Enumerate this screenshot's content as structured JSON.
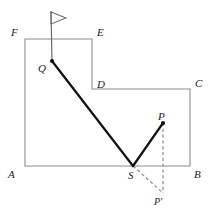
{
  "figure": {
    "canvas": {
      "width": 214,
      "height": 213
    },
    "colors": {
      "background": "#ffffff",
      "outline": "#8c8c8c",
      "path": "#111111",
      "dashed": "#9a9a9a",
      "label": "#1a1a1a",
      "flag": "#6e6e6e"
    },
    "stroke_widths": {
      "outline": 1.1,
      "path": 2.2,
      "dashed": 1.4,
      "flag_pole": 1.2
    }
  },
  "polygon": {
    "name": "ABCDEF",
    "closed": true,
    "points": "25,166 190,166 190,89 92,89 92,39 25,39",
    "vertices": [
      {
        "id": "A",
        "label": "A",
        "x": 25,
        "y": 166
      },
      {
        "id": "B",
        "label": "B",
        "x": 190,
        "y": 166
      },
      {
        "id": "C",
        "label": "C",
        "x": 190,
        "y": 89
      },
      {
        "id": "D",
        "label": "D",
        "x": 92,
        "y": 89
      },
      {
        "id": "E",
        "label": "E",
        "x": 92,
        "y": 39
      },
      {
        "id": "F",
        "label": "F",
        "x": 25,
        "y": 39
      }
    ]
  },
  "points": [
    {
      "id": "Q",
      "label": "Q",
      "x": 52,
      "y": 61,
      "dot": true
    },
    {
      "id": "S",
      "label": "S",
      "x": 133,
      "y": 166,
      "dot": false
    },
    {
      "id": "P",
      "label": "P",
      "x": 163,
      "y": 123,
      "dot": true
    },
    {
      "id": "Pp",
      "label": "P′",
      "x": 163,
      "y": 193,
      "dot": false
    }
  ],
  "segments": [
    {
      "id": "QS",
      "from": "Q",
      "to": "S",
      "x1": 52,
      "y1": 61,
      "x2": 133,
      "y2": 166,
      "style": "solid",
      "weight": "heavy"
    },
    {
      "id": "SP",
      "from": "S",
      "to": "P",
      "x1": 133,
      "y1": 166,
      "x2": 163,
      "y2": 123,
      "style": "solid",
      "weight": "heavy"
    }
  ],
  "dashed_segments": [
    {
      "id": "PPp",
      "from": "P",
      "to": "Pp",
      "x1": 163,
      "y1": 123,
      "x2": 163,
      "y2": 193,
      "style": "dashed"
    },
    {
      "id": "SPp",
      "from": "S",
      "to": "Pp",
      "x1": 133,
      "y1": 166,
      "x2": 163,
      "y2": 193,
      "style": "dashed"
    }
  ],
  "flag": {
    "name": "flag-marker",
    "pole": {
      "x1": 51,
      "y1": 11,
      "x2": 52,
      "y2": 61
    },
    "pennant_points": "51,12 66,18 51,24"
  },
  "labels": [
    {
      "id": "label-F",
      "text": "F",
      "x": 11,
      "y": 27,
      "size": "normal"
    },
    {
      "id": "label-E",
      "text": "E",
      "x": 97,
      "y": 27,
      "size": "normal"
    },
    {
      "id": "label-Q",
      "text": "Q",
      "x": 38,
      "y": 63,
      "size": "normal"
    },
    {
      "id": "label-D",
      "text": "D",
      "x": 97,
      "y": 79,
      "size": "normal"
    },
    {
      "id": "label-C",
      "text": "C",
      "x": 195,
      "y": 78,
      "size": "normal"
    },
    {
      "id": "label-P",
      "text": "P",
      "x": 158,
      "y": 111,
      "size": "normal"
    },
    {
      "id": "label-A",
      "text": "A",
      "x": 8,
      "y": 169,
      "size": "normal"
    },
    {
      "id": "label-S",
      "text": "S",
      "x": 128,
      "y": 170,
      "size": "normal"
    },
    {
      "id": "label-B",
      "text": "B",
      "x": 194,
      "y": 169,
      "size": "normal"
    },
    {
      "id": "label-Pp",
      "text": "P′",
      "x": 154,
      "y": 196,
      "size": "small"
    }
  ]
}
